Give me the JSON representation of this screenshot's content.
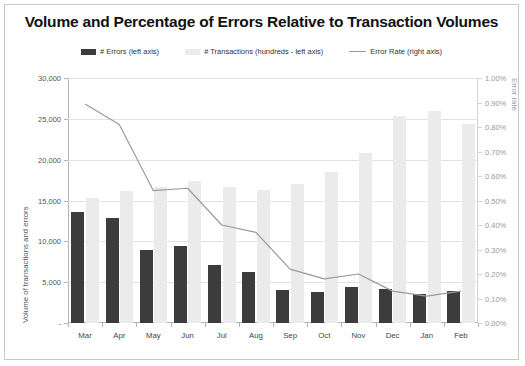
{
  "chart_data": {
    "type": "bar",
    "title": "Volume and Percentage of Errors Relative to Transaction Volumes",
    "xlabel": "",
    "ylabel": "Volume of transactions and errors",
    "y2label": "Error rate",
    "categories": [
      "Mar",
      "Apr",
      "May",
      "Jun",
      "Jul",
      "Aug",
      "Sep",
      "Oct",
      "Nov",
      "Dec",
      "Jan",
      "Feb"
    ],
    "ylim": [
      0,
      30000
    ],
    "y2lim": [
      0,
      0.01
    ],
    "ytick_labels": [
      "30,000",
      "25,000",
      "20,000",
      "15,000",
      "10,000",
      "5,000",
      "-"
    ],
    "ytick_values": [
      30000,
      25000,
      20000,
      15000,
      10000,
      5000,
      0
    ],
    "y2tick_labels": [
      "1.00%",
      "0.90%",
      "0.80%",
      "0.70%",
      "0.60%",
      "0.50%",
      "0.40%",
      "0.30%",
      "0.20%",
      "0.10%",
      "0.00%"
    ],
    "y2tick_values": [
      0.01,
      0.009,
      0.008,
      0.007,
      0.006,
      0.005,
      0.004,
      0.003,
      0.002,
      0.001,
      0
    ],
    "grid": true,
    "legend_position": "top",
    "series": [
      {
        "name": "# Errors (left axis)",
        "type": "bar",
        "axis": "left",
        "color": "#3c3c3c",
        "values": [
          13570,
          12800,
          8950,
          9400,
          7050,
          6250,
          4100,
          3750,
          4350,
          4150,
          3500,
          3950
        ]
      },
      {
        "name": "# Transactions (hundreds - left axis)",
        "type": "bar",
        "axis": "left",
        "color": "#ebebeb",
        "values": [
          15300,
          16150,
          16700,
          17450,
          16600,
          16250,
          17000,
          18500,
          20850,
          25400,
          25900,
          24400
        ]
      },
      {
        "name": "Error Rate (right axis)",
        "type": "line",
        "axis": "right",
        "color": "#9a9a9a",
        "values": [
          0.00894,
          0.0081,
          0.0054,
          0.0055,
          0.004,
          0.0037,
          0.0022,
          0.0018,
          0.002,
          0.0013,
          0.0011,
          0.0013
        ]
      }
    ]
  },
  "legend": {
    "items": [
      {
        "label": "# Errors (left axis)",
        "marker": "bar",
        "color": "#3c3c3c"
      },
      {
        "label": "# Transactions (hundreds - left axis)",
        "marker": "bar",
        "color": "#ebebeb"
      },
      {
        "label": "Error Rate (right axis)",
        "marker": "line",
        "color": "#9a9a9a"
      }
    ]
  }
}
